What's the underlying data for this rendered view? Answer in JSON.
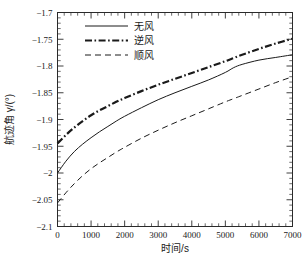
{
  "chart_data": {
    "type": "line",
    "title": "",
    "xlabel": "时间/s",
    "ylabel": "航迹角 γ/(°)",
    "ylabel_text": "航迹角",
    "ylabel_symbol": "γ/(°)",
    "xlim": [
      0,
      7000
    ],
    "ylim": [
      -2.1,
      -1.7
    ],
    "xticks": [
      0,
      1000,
      2000,
      3000,
      4000,
      5000,
      6000,
      7000
    ],
    "xtick_labels": [
      "0",
      "1000",
      "2000",
      "3000",
      "4000",
      "5000",
      "6000",
      "7000"
    ],
    "yticks": [
      -2.1,
      -2.05,
      -2,
      -1.95,
      -1.9,
      -1.85,
      -1.8,
      -1.75,
      -1.7
    ],
    "ytick_labels": [
      "−2.1",
      "−2.05",
      "−2",
      "−1.95",
      "−1.9",
      "−1.85",
      "−1.8",
      "−1.75",
      "−1.7"
    ],
    "grid": false,
    "minor_ticks_x": 5,
    "minor_ticks_y": 5,
    "legend_position": "upper-left-inside",
    "x": [
      0,
      250,
      500,
      750,
      1000,
      1250,
      1500,
      1750,
      2000,
      2500,
      3000,
      3500,
      4000,
      4500,
      5000,
      5250,
      5500,
      6000,
      6500,
      7000
    ],
    "series": [
      {
        "name": "无风",
        "label": "无风",
        "style": "solid",
        "linewidth": 1.0,
        "color": "#1a1a1a",
        "values": [
          -2.0,
          -1.978,
          -1.96,
          -1.946,
          -1.934,
          -1.923,
          -1.913,
          -1.903,
          -1.894,
          -1.878,
          -1.863,
          -1.85,
          -1.838,
          -1.826,
          -1.812,
          -1.803,
          -1.797,
          -1.789,
          -1.784,
          -1.779
        ]
      },
      {
        "name": "逆风",
        "label": "逆风",
        "style": "dashdot",
        "linewidth": 2.2,
        "color": "#1a1a1a",
        "values": [
          -1.945,
          -1.929,
          -1.915,
          -1.903,
          -1.892,
          -1.883,
          -1.875,
          -1.867,
          -1.86,
          -1.847,
          -1.835,
          -1.824,
          -1.813,
          -1.802,
          -1.791,
          -1.785,
          -1.779,
          -1.768,
          -1.758,
          -1.749
        ]
      },
      {
        "name": "顺风",
        "label": "顺风",
        "style": "dashed",
        "linewidth": 1.0,
        "color": "#1a1a1a",
        "values": [
          -2.056,
          -2.037,
          -2.02,
          -2.005,
          -1.992,
          -1.981,
          -1.971,
          -1.961,
          -1.952,
          -1.935,
          -1.92,
          -1.906,
          -1.893,
          -1.88,
          -1.867,
          -1.861,
          -1.855,
          -1.843,
          -1.831,
          -1.82
        ]
      }
    ]
  },
  "legend": {
    "entries": [
      {
        "label": "无风",
        "style": "solid"
      },
      {
        "label": "逆风",
        "style": "dashdot"
      },
      {
        "label": "顺风",
        "style": "dashed"
      }
    ]
  },
  "colors": {
    "foreground": "#1a1a1a",
    "background": "#ffffff",
    "axis": "#2a2a2a"
  }
}
